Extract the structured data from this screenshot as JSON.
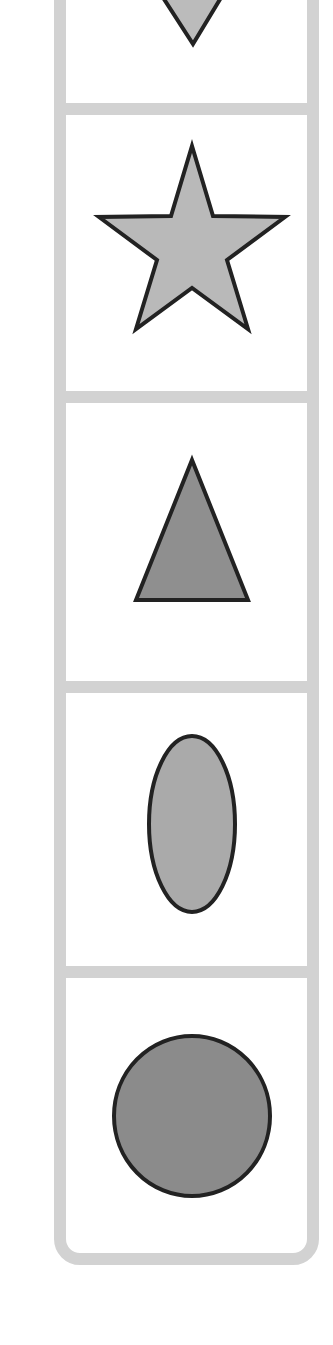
{
  "panel": {
    "name": "shape-column",
    "frame_color": "#d2d2d2",
    "stroke_color": "#222222",
    "cells": [
      {
        "shape": "heart",
        "icon": "heart-icon",
        "fill": "#bbbbbb",
        "partially_visible": true
      },
      {
        "shape": "star",
        "icon": "star-icon",
        "fill": "#b9b9b9"
      },
      {
        "shape": "triangle",
        "icon": "triangle-icon",
        "fill": "#8f8f8f"
      },
      {
        "shape": "ellipse",
        "icon": "ellipse-icon",
        "fill": "#aaaaaa"
      },
      {
        "shape": "circle",
        "icon": "circle-icon",
        "fill": "#8b8b8b"
      }
    ]
  }
}
